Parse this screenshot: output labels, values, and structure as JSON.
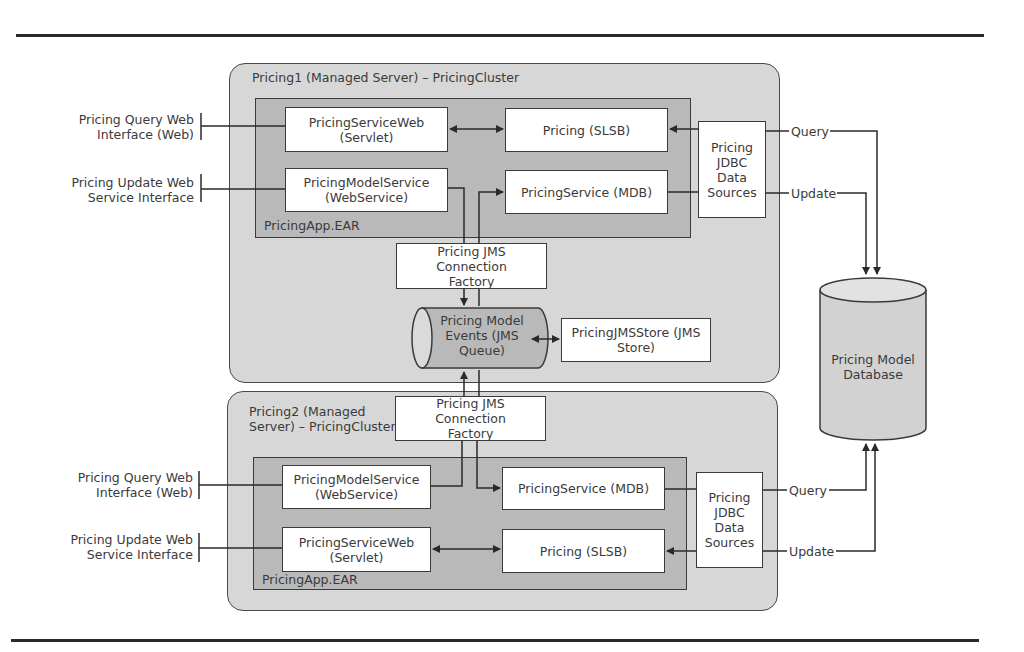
{
  "diagram": {
    "server1": {
      "title": "Pricing1 (Managed Server) – PricingCluster",
      "ear_label": "PricingApp.EAR",
      "components": {
        "service_web": "PricingServiceWeb\n(Servlet)",
        "slsb": "Pricing (SLSB)",
        "model_service": "PricingModelService\n(WebService)",
        "mdb": "PricingService (MDB)",
        "jdbc": "Pricing\nJDBC\nData\nSources",
        "jms_factory": "Pricing JMS Connection\nFactory"
      },
      "external": {
        "query_interface": "Pricing Query Web\nInterface (Web)",
        "update_interface": "Pricing Update Web\nService Interface"
      },
      "db_links": {
        "query": "Query",
        "update": "Update"
      }
    },
    "shared": {
      "queue": "Pricing Model\nEvents (JMS\nQueue)",
      "jms_store": "PricingJMSStore (JMS\nStore)",
      "database": "Pricing Model\nDatabase"
    },
    "server2": {
      "title": "Pricing2 (Managed\nServer) – PricingCluster",
      "ear_label": "PricingApp.EAR",
      "components": {
        "jms_factory": "Pricing JMS Connection\nFactory",
        "model_service": "PricingModelService\n(WebService)",
        "mdb": "PricingService (MDB)",
        "service_web": "PricingServiceWeb\n(Servlet)",
        "slsb": "Pricing (SLSB)",
        "jdbc": "Pricing\nJDBC\nData\nSources"
      },
      "external": {
        "query_interface": "Pricing Query Web\nInterface (Web)",
        "update_interface": "Pricing Update Web\nService Interface"
      },
      "db_links": {
        "query": "Query",
        "update": "Update"
      }
    },
    "colors": {
      "server_fill": "#d7d7d7",
      "ear_fill": "#b9b9b9",
      "component_fill": "#ffffff",
      "line": "#2a2a2a"
    }
  }
}
